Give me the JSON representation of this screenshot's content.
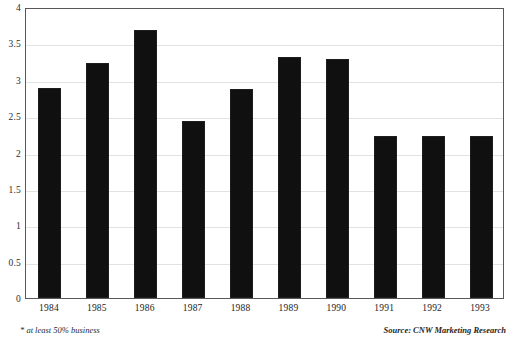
{
  "chart_data": {
    "type": "bar",
    "title": "",
    "subtitle": "",
    "xlabel": "",
    "ylabel": "",
    "categories": [
      "1984",
      "1985",
      "1986",
      "1987",
      "1988",
      "1989",
      "1990",
      "1991",
      "1992",
      "1993"
    ],
    "values": [
      2.89,
      3.23,
      3.68,
      2.43,
      2.87,
      3.31,
      3.29,
      2.23,
      2.23,
      2.23
    ],
    "series": [
      {
        "name": "",
        "values": [
          2.89,
          3.23,
          3.68,
          2.43,
          2.87,
          3.31,
          3.29,
          2.23,
          2.23,
          2.23
        ]
      }
    ],
    "ylim": [
      0,
      4
    ],
    "yticks": [
      0,
      0.5,
      1,
      1.5,
      2,
      2.5,
      3,
      3.5,
      4
    ],
    "ytick_labels": [
      "0",
      "0.5",
      "1",
      "1.5",
      "2",
      "2.5",
      "3",
      "3.5",
      "4"
    ],
    "grid": true,
    "legend": false,
    "legend_position": "none",
    "bar_color": "#101010",
    "grid_color": "#e2e2e2",
    "frame_color": "#58585a",
    "annotations": [
      "* at least 50% business",
      "Source: CNW Marketing Research"
    ]
  },
  "notes": {
    "footnote": "* at least 50% business",
    "source": "Source: CNW Marketing Research"
  }
}
